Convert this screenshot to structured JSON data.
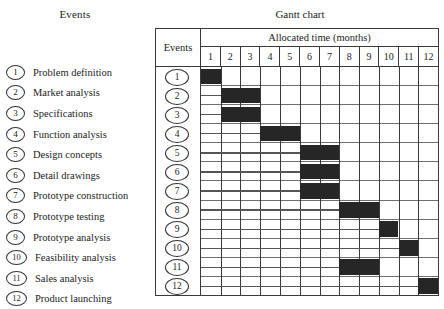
{
  "left_panel": {
    "title": "Events",
    "events": [
      {
        "num": "1",
        "label": "Problem definition"
      },
      {
        "num": "2",
        "label": "Market analysis"
      },
      {
        "num": "3",
        "label": "Specifications"
      },
      {
        "num": "4",
        "label": "Function analysis"
      },
      {
        "num": "5",
        "label": "Design concepts"
      },
      {
        "num": "6",
        "label": "Detail drawings"
      },
      {
        "num": "7",
        "label": "Prototype construction"
      },
      {
        "num": "8",
        "label": "Prototype testing"
      },
      {
        "num": "9",
        "label": "Prototype analysis"
      },
      {
        "num": "10",
        "label": "Feasibility analysis"
      },
      {
        "num": "11",
        "label": "Sales analysis"
      },
      {
        "num": "12",
        "label": "Product launching"
      }
    ]
  },
  "gantt": {
    "title": "Gantt chart",
    "events_header": "Events",
    "time_header": "Allocated time (months)",
    "months": [
      "1",
      "2",
      "3",
      "4",
      "5",
      "6",
      "7",
      "8",
      "9",
      "10",
      "11",
      "12"
    ],
    "row_labels": [
      "1",
      "2",
      "3",
      "4",
      "5",
      "6",
      "7",
      "8",
      "9",
      "10",
      "11",
      "12"
    ]
  },
  "colors": {
    "bar": "#262626",
    "grid": "#3a3a3a",
    "row_rule": "#6f6f6f",
    "background": "#ffffff",
    "text": "#1c1c1c"
  },
  "chart_data": {
    "type": "bar",
    "title": "Gantt chart",
    "xlabel": "Allocated time (months)",
    "ylabel": "Events",
    "xlim": [
      1,
      12
    ],
    "grid": true,
    "legend": "none",
    "orientation": "horizontal",
    "categories": [
      "Problem definition",
      "Market analysis",
      "Specifications",
      "Function analysis",
      "Design concepts",
      "Detail drawings",
      "Prototype construction",
      "Prototype testing",
      "Prototype analysis",
      "Feasibility analysis",
      "Sales analysis",
      "Product launching"
    ],
    "tasks": [
      {
        "id": 1,
        "name": "Problem definition",
        "start_month": 1,
        "end_month": 1,
        "duration": 1
      },
      {
        "id": 2,
        "name": "Market analysis",
        "start_month": 2,
        "end_month": 3,
        "duration": 2
      },
      {
        "id": 3,
        "name": "Specifications",
        "start_month": 2,
        "end_month": 3,
        "duration": 2
      },
      {
        "id": 4,
        "name": "Function analysis",
        "start_month": 4,
        "end_month": 5,
        "duration": 2
      },
      {
        "id": 5,
        "name": "Design concepts",
        "start_month": 6,
        "end_month": 7,
        "duration": 2
      },
      {
        "id": 6,
        "name": "Detail drawings",
        "start_month": 6,
        "end_month": 7,
        "duration": 2
      },
      {
        "id": 7,
        "name": "Prototype construction",
        "start_month": 6,
        "end_month": 7,
        "duration": 2
      },
      {
        "id": 8,
        "name": "Prototype testing",
        "start_month": 8,
        "end_month": 9,
        "duration": 2
      },
      {
        "id": 9,
        "name": "Prototype analysis",
        "start_month": 10,
        "end_month": 10,
        "duration": 1
      },
      {
        "id": 10,
        "name": "Feasibility analysis",
        "start_month": 11,
        "end_month": 11,
        "duration": 1
      },
      {
        "id": 11,
        "name": "Sales analysis",
        "start_month": 8,
        "end_month": 9,
        "duration": 2
      },
      {
        "id": 12,
        "name": "Product launching",
        "start_month": 12,
        "end_month": 12,
        "duration": 1
      }
    ]
  }
}
